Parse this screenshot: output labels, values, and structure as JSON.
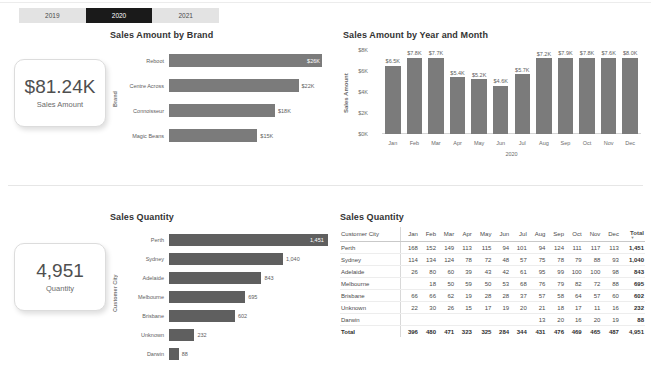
{
  "slicer": {
    "name": "year-slicer",
    "options": [
      "2019",
      "2020",
      "2021"
    ],
    "selected": "2020"
  },
  "kpis": [
    {
      "value": "$81.24K",
      "label": "Sales Amount"
    },
    {
      "value": "4,951",
      "label": "Quantity"
    }
  ],
  "sales_by_brand": {
    "title": "Sales Amount by Brand",
    "axis_title": "Brand"
  },
  "sales_by_month": {
    "title": "Sales Amount by Year and Month",
    "y_axis_title": "Sales Amount",
    "x_axis_year": "2020"
  },
  "sales_quantity_bar": {
    "title": "Sales Quantity",
    "axis_title": "Customer City"
  },
  "matrix": {
    "title": "Sales Quantity",
    "columns": [
      "Customer City",
      "Jan",
      "Feb",
      "Mar",
      "Apr",
      "May",
      "Jun",
      "Jul",
      "Aug",
      "Sep",
      "Oct",
      "Nov",
      "Dec",
      "Total"
    ],
    "rows": [
      {
        "city": "Perth",
        "values": [
          "168",
          "152",
          "149",
          "113",
          "115",
          "94",
          "101",
          "94",
          "124",
          "111",
          "117",
          "113"
        ],
        "total": "1,451"
      },
      {
        "city": "Sydney",
        "values": [
          "114",
          "134",
          "124",
          "78",
          "72",
          "48",
          "57",
          "75",
          "78",
          "79",
          "88",
          "93"
        ],
        "total": "1,040"
      },
      {
        "city": "Adelaide",
        "values": [
          "26",
          "80",
          "60",
          "39",
          "43",
          "42",
          "61",
          "95",
          "99",
          "100",
          "100",
          "98"
        ],
        "total": "843"
      },
      {
        "city": "Melbourne",
        "values": [
          "",
          "18",
          "50",
          "59",
          "50",
          "53",
          "68",
          "76",
          "79",
          "82",
          "72",
          "88"
        ],
        "total": "695"
      },
      {
        "city": "Brisbane",
        "values": [
          "66",
          "66",
          "62",
          "19",
          "28",
          "28",
          "37",
          "57",
          "58",
          "64",
          "57",
          "60"
        ],
        "total": "602"
      },
      {
        "city": "Unknown",
        "values": [
          "22",
          "30",
          "26",
          "15",
          "17",
          "19",
          "20",
          "21",
          "18",
          "17",
          "11",
          "16"
        ],
        "total": "232"
      },
      {
        "city": "Darwin",
        "values": [
          "",
          "",
          "",
          "",
          "",
          "",
          "",
          "13",
          "20",
          "16",
          "20",
          "19"
        ],
        "total": "88"
      }
    ],
    "total_row": {
      "city": "Total",
      "values": [
        "396",
        "480",
        "471",
        "323",
        "325",
        "284",
        "344",
        "431",
        "476",
        "469",
        "465",
        "487"
      ],
      "total": "4,951"
    },
    "sort_column": "Total"
  },
  "chart_data": [
    {
      "type": "bar",
      "orientation": "horizontal",
      "title": "Sales Amount by Brand",
      "xlabel": "",
      "ylabel": "Brand",
      "categories": [
        "Reboot",
        "Centre Across",
        "Connoisseur",
        "Magic Beans"
      ],
      "values": [
        26000,
        22000,
        18000,
        15000
      ],
      "value_labels": [
        "$26K",
        "$22K",
        "$18K",
        "$15K"
      ],
      "xlim": [
        0,
        27000
      ],
      "grid": false,
      "legend": "none",
      "bar_color": "#7b7b7b"
    },
    {
      "type": "bar",
      "orientation": "vertical",
      "title": "Sales Amount by Year and Month",
      "xlabel": "2020",
      "ylabel": "Sales Amount",
      "categories": [
        "Jan",
        "Feb",
        "Mar",
        "Apr",
        "May",
        "Jun",
        "Jul",
        "Aug",
        "Sep",
        "Oct",
        "Nov",
        "Dec"
      ],
      "values": [
        6500,
        7800,
        7700,
        5400,
        5200,
        4600,
        5700,
        7200,
        7900,
        7800,
        7600,
        8000
      ],
      "value_labels": [
        "$6.5K",
        "$7.8K",
        "$7.7K",
        "$5.4K",
        "$5.2K",
        "$4.6K",
        "$5.7K",
        "$7.2K",
        "$7.9K",
        "$7.8K",
        "$7.6K",
        "$8.0K"
      ],
      "ylim": [
        0,
        8000
      ],
      "yticks": [
        "$0K",
        "$2K",
        "$4K",
        "$6K",
        "$8K"
      ],
      "grid": false,
      "legend": "none",
      "bar_color": "#7b7b7b"
    },
    {
      "type": "bar",
      "orientation": "horizontal",
      "title": "Sales Quantity",
      "xlabel": "",
      "ylabel": "Customer City",
      "categories": [
        "Perth",
        "Sydney",
        "Adelaide",
        "Melbourne",
        "Brisbane",
        "Unknown",
        "Darwin"
      ],
      "values": [
        1451,
        1040,
        843,
        695,
        602,
        232,
        88
      ],
      "value_labels": [
        "1,451",
        "1,040",
        "843",
        "695",
        "602",
        "232",
        "88"
      ],
      "xlim": [
        0,
        1451
      ],
      "grid": false,
      "legend": "none",
      "bar_color": "#5f5f5f"
    }
  ]
}
